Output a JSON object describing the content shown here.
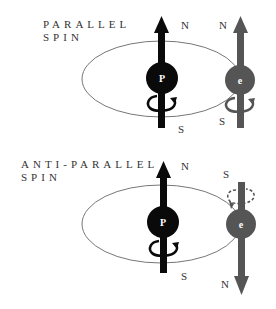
{
  "panels": [
    {
      "title_line1": "PARALLEL",
      "title_line2": "SPIN",
      "proton": {
        "letter": "P",
        "top_pole": "N",
        "bottom_pole": "S"
      },
      "electron": {
        "letter": "e",
        "top_pole": "N",
        "bottom_pole": "S",
        "direction": "up"
      }
    },
    {
      "title_line1": "ANTI-PARALLEL",
      "title_line2": "SPIN",
      "proton": {
        "letter": "P",
        "top_pole": "N",
        "bottom_pole": "S"
      },
      "electron": {
        "letter": "e",
        "top_pole": "S",
        "bottom_pole": "N",
        "direction": "down"
      }
    }
  ],
  "colors": {
    "proton": "#0a0a0a",
    "electron": "#555555",
    "orbit": "#777777",
    "text": "#333333"
  }
}
